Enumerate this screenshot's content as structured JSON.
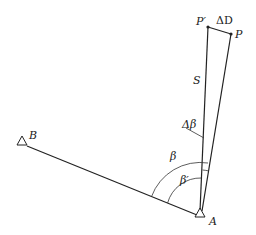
{
  "diagram": {
    "type": "surveying-angle-correction",
    "points": {
      "A": {
        "label": "A",
        "symbol": "triangle"
      },
      "B": {
        "label": "B",
        "symbol": "triangle"
      },
      "P": {
        "label": "P"
      },
      "P_prime": {
        "label": "P′"
      }
    },
    "segments": {
      "S": {
        "label": "S"
      },
      "delta_D": {
        "label": "ΔD"
      }
    },
    "angles": {
      "beta": {
        "label": "β"
      },
      "beta_prime": {
        "label": "β′"
      },
      "delta_beta": {
        "label": "Δβ"
      }
    }
  }
}
